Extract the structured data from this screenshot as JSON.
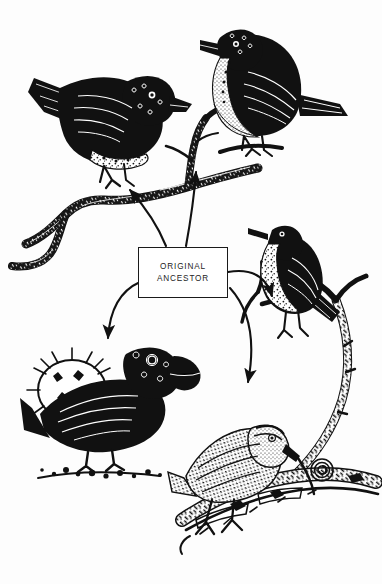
{
  "figure": {
    "background_color": "#fdfdfd",
    "ink_color": "#111111",
    "width": 382,
    "height": 584,
    "style": "black-and-white scratchboard / pen-and-ink engraving"
  },
  "center_label": {
    "name": "original-ancestor-box",
    "line1": "ORIGINAL",
    "line2": "ANCESTOR",
    "border_color": "#1a1a1a",
    "fill_color": "#ffffff"
  },
  "caption": {
    "text": "",
    "note_visible": "caption text is clipped at the bottom edge of the image"
  },
  "birds": [
    {
      "id": "top-left-finch",
      "label": "dark ground finch perched on branch, facing right",
      "plumage": "solid black body with speckled white flank barring",
      "beak": "short, deep, conical",
      "facing": "right",
      "position": {
        "x": 22,
        "y": 58,
        "w": 168,
        "h": 128
      }
    },
    {
      "id": "top-right-finch",
      "label": "pale-breasted finch on twig, facing left",
      "plumage": "dark back and wings, white stippled breast and belly",
      "beak": "stout, medium conical",
      "facing": "left",
      "position": {
        "x": 182,
        "y": 12,
        "w": 140,
        "h": 140
      }
    },
    {
      "id": "right-warbler-finch",
      "label": "warbler finch perched upright on vertical branch, facing left",
      "plumage": "dark crown and back, mottled pale breast",
      "beak": "slender, pointed, warbler-like",
      "facing": "left",
      "position": {
        "x": 246,
        "y": 218,
        "w": 118,
        "h": 126
      }
    },
    {
      "id": "bottom-left-cactus-finch",
      "label": "large ground finch beside spiny cactus pad, facing right",
      "plumage": "solid black",
      "beak": "very large, heavy, crushing",
      "facing": "right",
      "position": {
        "x": 18,
        "y": 338,
        "w": 150,
        "h": 122
      }
    },
    {
      "id": "bottom-right-woodpecker-finch",
      "label": "woodpecker finch probing bark with a cactus-spine tool in its bill",
      "plumage": "streaked brown-and-white stippling",
      "beak": "straight, chisel-like, holding a twig",
      "facing": "right",
      "position": {
        "x": 172,
        "y": 404,
        "w": 178,
        "h": 140
      }
    }
  ],
  "arrows": [
    {
      "id": "arrow-to-top-left",
      "from": "original-ancestor-box",
      "to": "top-left-finch",
      "direction": "up-left"
    },
    {
      "id": "arrow-to-top-right",
      "from": "original-ancestor-box",
      "to": "top-right-finch",
      "direction": "up"
    },
    {
      "id": "arrow-to-right-warbler",
      "from": "original-ancestor-box",
      "to": "right-warbler-finch",
      "direction": "up-right"
    },
    {
      "id": "arrow-to-bottom-left",
      "from": "original-ancestor-box",
      "to": "bottom-left-cactus-finch",
      "direction": "down-left"
    },
    {
      "id": "arrow-to-bottom-right",
      "from": "original-ancestor-box",
      "to": "bottom-right-woodpecker-finch",
      "direction": "down-right"
    }
  ],
  "branches": [
    {
      "id": "upper-branch",
      "label": "gnarled horizontal branch supporting the two upper finches"
    },
    {
      "id": "right-branch",
      "label": "curving vertical branch supporting the warbler finch"
    },
    {
      "id": "lower-log",
      "label": "weathered log / bark where the woodpecker finch probes"
    },
    {
      "id": "cactus-pad",
      "label": "spiny prickly-pear cactus pad at lower left"
    }
  ]
}
